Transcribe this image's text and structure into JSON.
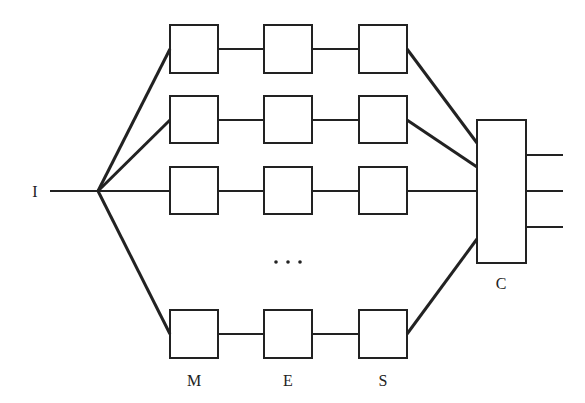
{
  "diagram": {
    "input_label": "I",
    "combiner_label": "C",
    "column_labels": [
      "M",
      "E",
      "S"
    ],
    "ellipsis": "• • •",
    "line_color": "#222222",
    "rows": 4,
    "outputs": 3
  }
}
